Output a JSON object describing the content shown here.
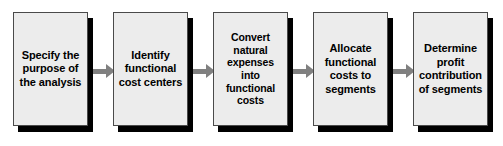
{
  "diagram": {
    "type": "process-flow",
    "orientation": "left-to-right",
    "background_color": "#ffffff",
    "node_fill_color": "#ececec",
    "node_border_color": "#4a4a4a",
    "node_shadow_color": "#000000",
    "arrow_color": "#808080",
    "text_color": "#000000",
    "nodes": [
      {
        "id": "node-1",
        "step": 1,
        "label": "Specify the\npurpose of\nthe analysis",
        "lines": [
          "Specify the",
          "purpose of",
          "the analysis"
        ]
      },
      {
        "id": "node-2",
        "step": 2,
        "label": "Identify\nfunctional\ncost centers",
        "lines": [
          "Identify",
          "functional",
          "cost centers"
        ]
      },
      {
        "id": "node-3",
        "step": 3,
        "label": "Convert\nnatural\nexpenses\ninto\nfunctional\ncosts",
        "lines": [
          "Convert",
          "natural",
          "expenses",
          "into",
          "functional",
          "costs"
        ]
      },
      {
        "id": "node-4",
        "step": 4,
        "label": "Allocate\nfunctional\ncosts to\nsegments",
        "lines": [
          "Allocate",
          "functional",
          "costs to",
          "segments"
        ]
      },
      {
        "id": "node-5",
        "step": 5,
        "label": "Determine\nprofit\ncontribution\nof segments",
        "lines": [
          "Determine",
          "profit",
          "contribution",
          "of segments"
        ]
      }
    ],
    "connectors": [
      {
        "id": "arrow-1",
        "from": "node-1",
        "to": "node-2"
      },
      {
        "id": "arrow-2",
        "from": "node-2",
        "to": "node-3"
      },
      {
        "id": "arrow-3",
        "from": "node-3",
        "to": "node-4"
      },
      {
        "id": "arrow-4",
        "from": "node-4",
        "to": "node-5"
      }
    ]
  }
}
